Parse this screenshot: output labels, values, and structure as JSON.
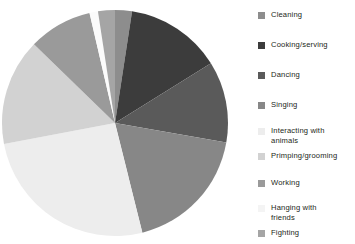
{
  "chart_data": {
    "type": "pie",
    "title": "",
    "categories": [
      "Cleaning",
      "Cooking/serving",
      "Dancing",
      "Singing",
      "Interacting with animals",
      "Primping/grooming",
      "Working",
      "Hanging with friends",
      "Fighting"
    ],
    "values": [
      2.2,
      12.5,
      10.6,
      16.7,
      23.6,
      13.9,
      8.3,
      1.1,
      2.2
    ],
    "units": "percent",
    "legend_position": "right",
    "grid": false,
    "start_angle_deg": 0,
    "direction": "clockwise",
    "slice_colors": [
      "#8d8d8d",
      "#3c3c3c",
      "#5a5a5a",
      "#878787",
      "#ededed",
      "#d2d2d2",
      "#9a9a9a",
      "#fbfbfb",
      "#a5a5a5"
    ]
  },
  "legend": {
    "items": [
      {
        "label": "Cleaning",
        "color": "#8d8d8d"
      },
      {
        "label": "Cooking/serving",
        "color": "#3c3c3c"
      },
      {
        "label": "Dancing",
        "color": "#5a5a5a"
      },
      {
        "label": "Singing",
        "color": "#878787"
      },
      {
        "label": "Interacting with\nanimals",
        "color": "#ededed"
      },
      {
        "label": "Primping/grooming",
        "color": "#d2d2d2"
      },
      {
        "label": "Working",
        "color": "#9a9a9a"
      },
      {
        "label": "Hanging with\nfriends",
        "color": "#f4f4f4"
      },
      {
        "label": "Fighting",
        "color": "#a5a5a5"
      }
    ]
  },
  "layout": {
    "legend_tops": [
      10,
      40,
      70,
      100,
      126,
      151,
      178,
      203,
      228
    ],
    "pie": {
      "cx": 115,
      "cy": 123,
      "r": 113
    }
  }
}
